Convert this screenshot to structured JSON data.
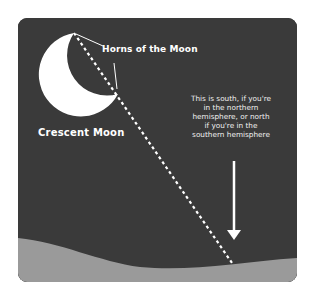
{
  "diagram": {
    "title": "Crescent Moon",
    "labels": {
      "horns": "Horns of the Moon",
      "moon": "Crescent Moon",
      "note": "This is south, if you're in the northern hemisphere, or north if you're in the southern hemisphere"
    },
    "note_lines": [
      "This is south, if you're",
      "in the northern",
      "hemisphere, or north",
      "if you're in the",
      "southern hemisphere"
    ],
    "colors": {
      "sky": "#3a3a3a",
      "ground": "#9a9a9a",
      "moon": "#ffffff",
      "lines": "#ffffff",
      "background": "#ffffff"
    },
    "elements": {
      "dashed_line": "line through the two horns of the moon extended down to the horizon",
      "arrow": "downward arrow pointing to horizon"
    }
  }
}
